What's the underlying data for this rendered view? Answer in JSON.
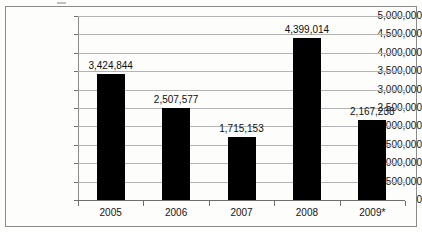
{
  "chart_data": {
    "type": "bar",
    "title": "",
    "subtitle": "",
    "xlabel": "",
    "ylabel": "",
    "categories": [
      "2005",
      "2006",
      "2007",
      "2008",
      "2009*"
    ],
    "values": [
      3424844,
      2507577,
      1715153,
      4399014,
      2167238
    ],
    "value_labels": [
      "3,424,844",
      "2,507,577",
      "1,715,153",
      "4,399,014",
      "2,167,238"
    ],
    "ylim": [
      0,
      5000000
    ],
    "ytick_values": [
      0,
      500000,
      1000000,
      1500000,
      2000000,
      2500000,
      3000000,
      3500000,
      4000000,
      4500000,
      5000000
    ],
    "ytick_labels": [
      "0",
      "500,000",
      "1,000,000",
      "1,500,000",
      "2,000,000",
      "2,500,000",
      "3,000,000",
      "3,500,000",
      "4,000,000",
      "4,500,000",
      "5,000,000"
    ],
    "grid": true,
    "legend": false,
    "bar_color": "#000000",
    "gridline_color": "#b4b4b4",
    "axis_color": "#6e6e6e",
    "background_color": "#fdfdfc",
    "border_color": "#8a8a8a",
    "data_labels_shown": true
  }
}
